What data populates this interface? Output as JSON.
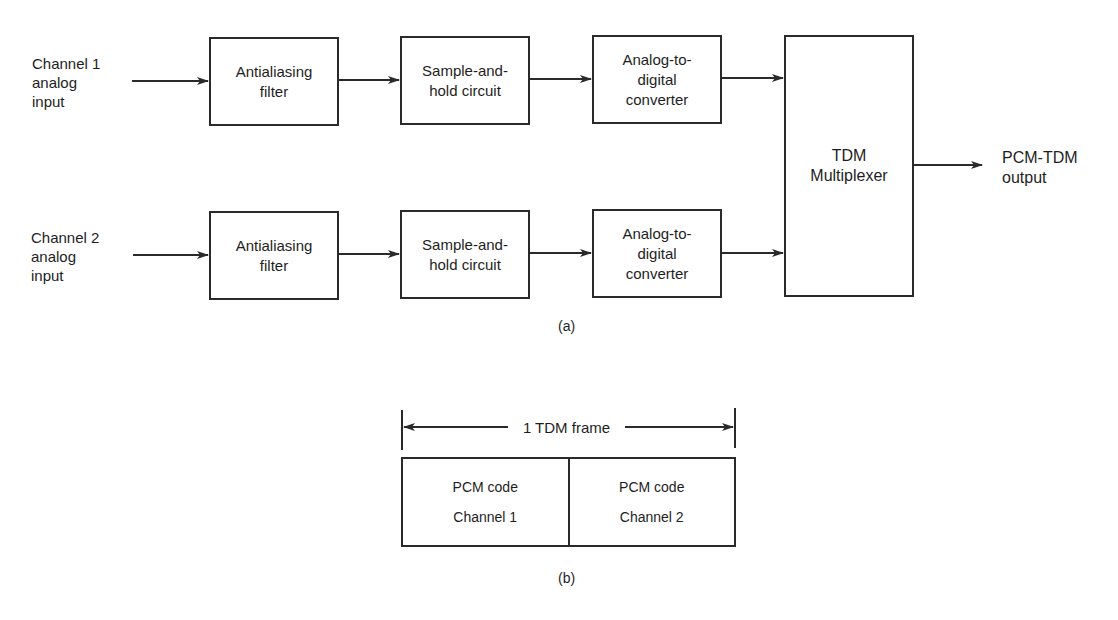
{
  "part_a": {
    "caption": "(a)",
    "channel1": {
      "input_label": "Channel 1\nanalog\ninput",
      "blocks": [
        "Antialiasing\nfilter",
        "Sample-and-\nhold circuit",
        "Analog-to-\ndigital\nconverter"
      ]
    },
    "channel2": {
      "input_label": "Channel 2\nanalog\ninput",
      "blocks": [
        "Antialiasing\nfilter",
        "Sample-and-\nhold circuit",
        "Analog-to-\ndigital\nconverter"
      ]
    },
    "multiplexer": "TDM\nMultiplexer",
    "output_label": "PCM-TDM\noutput"
  },
  "part_b": {
    "caption": "(b)",
    "frame_label": "1 TDM frame",
    "slots": [
      {
        "line1": "PCM code",
        "line2": "Channel 1"
      },
      {
        "line1": "PCM code",
        "line2": "Channel 2"
      }
    ]
  },
  "colors": {
    "stroke": "#2a2a2a",
    "text": "#1e1e1e",
    "background": "#ffffff"
  }
}
